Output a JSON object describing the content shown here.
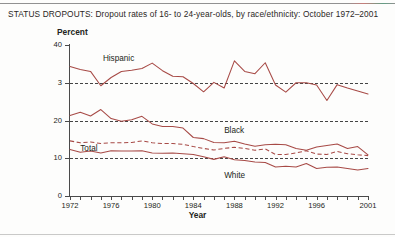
{
  "figure": {
    "title": "STATUS DROPOUTS: Dropout rates of 16- to 24-year-olds, by race/ethnicity: October 1972–2001"
  },
  "axes": {
    "ylabel": "Percent",
    "xlabel": "Year",
    "y_ticks": [
      "0",
      "10",
      "20",
      "3",
      "40"
    ],
    "x_ticks": [
      "1972",
      "1976",
      "1980",
      "1984",
      "1988",
      "1992",
      "1996",
      "2001"
    ]
  },
  "series_labels": {
    "hispanic": "Hispanic",
    "black": "Black",
    "white": "White",
    "total": "Total"
  },
  "colors": {
    "line": "#a74a46",
    "axis": "#4a4a4a",
    "grid": "#3a3a3a",
    "text": "#231f20",
    "background": "#fdfdfc"
  },
  "chart_data": {
    "type": "line",
    "title": "STATUS DROPOUTS: Dropout rates of 16- to 24-year-olds, by race/ethnicity: October 1972–2001",
    "xlabel": "Year",
    "ylabel": "Percent",
    "xlim": [
      1972,
      2001
    ],
    "ylim": [
      0,
      40
    ],
    "y_ticks": [
      0,
      10,
      20,
      30,
      40
    ],
    "x_tick_values": [
      1972,
      1976,
      1980,
      1984,
      1988,
      1992,
      1996,
      2001
    ],
    "grid": "horizontal dashed at 10, 20, 30",
    "legend": "inline labels on plot",
    "x": [
      1972,
      1973,
      1974,
      1975,
      1976,
      1977,
      1978,
      1979,
      1980,
      1981,
      1982,
      1983,
      1984,
      1985,
      1986,
      1987,
      1988,
      1989,
      1990,
      1991,
      1992,
      1993,
      1994,
      1995,
      1996,
      1997,
      1998,
      1999,
      2000,
      2001
    ],
    "series": [
      {
        "name": "Hispanic",
        "style": "solid",
        "values": [
          34.3,
          33.5,
          33.0,
          29.2,
          31.4,
          33.0,
          33.3,
          33.8,
          35.2,
          33.2,
          31.7,
          31.6,
          29.8,
          27.6,
          30.1,
          28.6,
          35.8,
          33.0,
          32.4,
          35.3,
          29.4,
          27.5,
          30.0,
          30.0,
          29.4,
          25.3,
          29.5,
          28.6,
          27.8,
          27.0
        ]
      },
      {
        "name": "Black",
        "style": "solid",
        "values": [
          21.3,
          22.2,
          21.2,
          22.9,
          20.5,
          19.8,
          20.2,
          21.1,
          19.1,
          18.4,
          18.4,
          18.0,
          15.5,
          15.2,
          14.2,
          14.1,
          14.5,
          13.8,
          13.2,
          13.6,
          13.7,
          13.6,
          12.6,
          12.1,
          13.0,
          13.4,
          13.8,
          12.6,
          13.1,
          10.9
        ]
      },
      {
        "name": "Total",
        "style": "dashed",
        "values": [
          14.6,
          14.1,
          14.3,
          13.9,
          14.1,
          14.1,
          14.2,
          14.6,
          14.1,
          13.9,
          13.9,
          13.7,
          13.1,
          12.6,
          12.2,
          12.6,
          12.9,
          12.6,
          12.1,
          12.5,
          11.0,
          11.0,
          11.4,
          12.0,
          11.1,
          11.0,
          11.8,
          11.2,
          10.9,
          10.7
        ]
      },
      {
        "name": "White",
        "style": "solid",
        "values": [
          12.3,
          11.6,
          11.9,
          11.4,
          12.0,
          11.9,
          11.9,
          12.0,
          11.4,
          11.3,
          11.4,
          11.2,
          11.0,
          10.4,
          9.7,
          10.4,
          9.6,
          9.4,
          9.0,
          8.9,
          7.7,
          7.9,
          7.7,
          8.6,
          7.3,
          7.6,
          7.7,
          7.3,
          6.9,
          7.3
        ]
      }
    ]
  }
}
